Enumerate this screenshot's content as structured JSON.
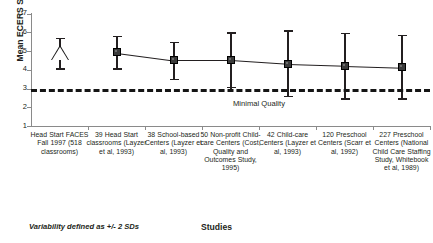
{
  "chart_data": {
    "type": "line",
    "title": "",
    "xlabel": "Studies",
    "ylabel": "Mean ECERS Score",
    "ylim": [
      1,
      7
    ],
    "yticks": [
      1,
      2,
      3,
      4,
      5,
      6,
      7
    ],
    "ytick_labels": [
      "1",
      "2",
      "3",
      "4",
      "5",
      "6",
      "7"
    ],
    "grid": false,
    "legend": "none",
    "footnote": "Variability defined as +/- 2 SDs",
    "threshold": {
      "value": 3,
      "label": "Minimal Quality",
      "style": "dashed"
    },
    "categories": [
      "Head Start FACES Fall 1997 (518 classrooms)",
      "39 Head Start classrooms (Layzer et al, 1993)",
      "38 School-based Centers (Layzer et al, 1993)",
      "50 Non-profit Child-care Centers (Cost, Quality and Outcomes Study, 1995)",
      "42 Child-care Centers (Layzer et al, 1993)",
      "120 Preschool Centers (Scarr et al, 1992)",
      "227 Preschool Centers (National Child Care Staffing Study, Whitebook et al, 1989)"
    ],
    "series": [
      {
        "name": "Head Start FACES (reference)",
        "marker": "open-triangle",
        "connected": false,
        "points": [
          {
            "category_index": 0,
            "value": 4.85,
            "lower": 4.0,
            "upper": 5.7
          }
        ]
      },
      {
        "name": "Comparison studies",
        "marker": "filled-square",
        "connected": true,
        "points": [
          {
            "category_index": 1,
            "value": 4.9,
            "lower": 4.0,
            "upper": 5.8
          },
          {
            "category_index": 2,
            "value": 4.5,
            "lower": 3.45,
            "upper": 5.5
          },
          {
            "category_index": 3,
            "value": 4.5,
            "lower": 3.0,
            "upper": 6.0
          },
          {
            "category_index": 4,
            "value": 4.3,
            "lower": 2.55,
            "upper": 6.1
          },
          {
            "category_index": 5,
            "value": 4.2,
            "lower": 2.4,
            "upper": 5.95
          },
          {
            "category_index": 6,
            "value": 4.1,
            "lower": 2.4,
            "upper": 5.85
          }
        ]
      }
    ]
  }
}
